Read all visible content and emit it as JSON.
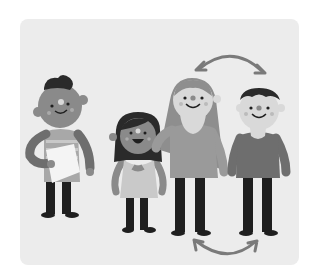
{
  "illustration": {
    "subject": "four cartoon people standing in a row with two curved swap arrows",
    "palette": {
      "card_bg": "#ececec",
      "skin_dark": "#8a8a8a",
      "skin_light": "#d9d9d9",
      "hair_black": "#2a2a2a",
      "hair_gray": "#8e8e8e",
      "shirt_dark": "#6e6e6e",
      "shirt_mid": "#9a9a9a",
      "shirt_light": "#c9c9c9",
      "pants": "#1f1f1f",
      "paper": "#f4f4f4",
      "arrow": "#7a7a7a"
    },
    "figures": [
      {
        "id": "boy-with-paper",
        "description": "boy with curly dark hair, striped shirt, holding paper"
      },
      {
        "id": "girl-smiling",
        "description": "girl with dark hair, light tank top, open smile"
      },
      {
        "id": "woman-long-hair",
        "description": "woman with long gray hair, gray top, arm around girl"
      },
      {
        "id": "man-short-hair",
        "description": "man with short dark hair, darker sweater"
      }
    ],
    "arrows": [
      {
        "id": "swap-arrow-top",
        "direction": "bidirectional",
        "position": "above woman and man"
      },
      {
        "id": "swap-arrow-bottom",
        "direction": "bidirectional",
        "position": "below woman and man"
      }
    ]
  }
}
